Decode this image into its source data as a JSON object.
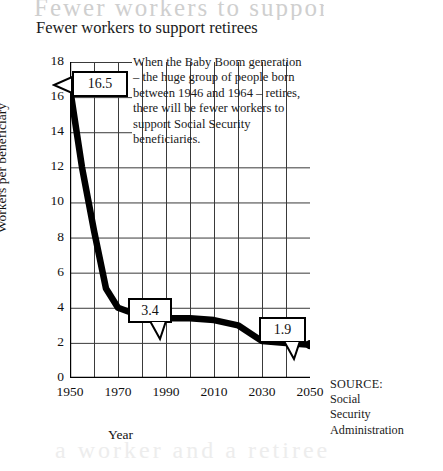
{
  "chart_data": {
    "type": "line",
    "title": "Fewer workers to support retirees",
    "xlabel": "Year",
    "ylabel": "Workers per beneficiary",
    "xlim": [
      1950,
      2050
    ],
    "ylim": [
      0,
      18
    ],
    "xticks": [
      1950,
      1970,
      1990,
      2010,
      2030,
      2050
    ],
    "yticks": [
      0,
      2,
      4,
      6,
      8,
      10,
      12,
      14,
      16,
      18
    ],
    "gridlines_x_every": 10,
    "gridlines_y_every": 2,
    "grid": true,
    "legend": "none",
    "x": [
      1950,
      1955,
      1960,
      1965,
      1970,
      1980,
      1990,
      2000,
      2010,
      2020,
      2030,
      2040,
      2050
    ],
    "values": [
      16.5,
      12.0,
      8.4,
      5.1,
      4.0,
      3.5,
      3.4,
      3.4,
      3.3,
      3.0,
      2.1,
      2.0,
      1.9
    ],
    "markers": [
      {
        "x": 1950,
        "y": 16.5
      },
      {
        "x": 1990,
        "y": 3.4
      },
      {
        "x": 2050,
        "y": 1.9
      }
    ],
    "data_labels": [
      {
        "text": "16.5",
        "x": 1950,
        "y": 16.5
      },
      {
        "text": "3.4",
        "x": 1990,
        "y": 3.4
      },
      {
        "text": "1.9",
        "x": 2050,
        "y": 1.9
      }
    ],
    "annotations": [
      "When the Baby Boom generation",
      "– the huge group of people born",
      "between 1946 and 1964 – retires,",
      "there will be fewer workers  to",
      "support Social Security",
      "beneficiaries."
    ],
    "source": [
      "SOURCE:",
      "Social",
      "Security",
      "Administration"
    ],
    "colors": {
      "line": "#000000",
      "grid": "#3a3a3a",
      "axis": "#000000",
      "background": "#ffffff",
      "text": "#111111"
    }
  },
  "ghost_text": {
    "top": "Fewer workers to support retirees",
    "bottom": "a worker and a retiree"
  }
}
